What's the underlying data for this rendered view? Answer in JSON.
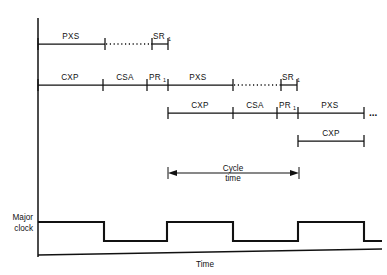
{
  "figure": {
    "axis": {
      "x_label": "Time",
      "y_label_line1": "Major",
      "y_label_line2": "clock"
    },
    "annotation": {
      "line1": "Cycle",
      "line2": "time"
    },
    "continuation_marker": "...",
    "colors": {
      "ink": "#111111",
      "background": "#ffffff"
    },
    "rows": [
      {
        "name": "row-1",
        "y": 44,
        "x_start": 38,
        "x_end": 168,
        "segments": [
          {
            "label": "PXS",
            "x1": 38,
            "x2": 105,
            "style": "solid"
          },
          {
            "label": "",
            "x1": 105,
            "x2": 152,
            "style": "dotted"
          },
          {
            "label": "SR",
            "sub": "1",
            "x1": 152,
            "x2": 168,
            "style": "solid"
          }
        ]
      },
      {
        "name": "row-2",
        "y": 85,
        "x_start": 38,
        "x_end": 297,
        "segments": [
          {
            "label": "CXP",
            "x1": 38,
            "x2": 103,
            "style": "solid"
          },
          {
            "label": "CSA",
            "x1": 103,
            "x2": 147,
            "style": "solid"
          },
          {
            "label": "PR",
            "sub": "1",
            "x1": 147,
            "x2": 168,
            "style": "solid"
          },
          {
            "label": "PXS",
            "x1": 168,
            "x2": 233,
            "style": "solid"
          },
          {
            "label": "",
            "x1": 233,
            "x2": 281,
            "style": "dotted"
          },
          {
            "label": "SR",
            "sub": "1",
            "x1": 281,
            "x2": 297,
            "style": "solid"
          }
        ]
      },
      {
        "name": "row-3",
        "y": 113,
        "x_start": 168,
        "x_end": 364,
        "trailing_ellipsis": "...",
        "segments": [
          {
            "label": "CXP",
            "x1": 168,
            "x2": 233,
            "style": "solid"
          },
          {
            "label": "CSA",
            "x1": 233,
            "x2": 277,
            "style": "solid"
          },
          {
            "label": "PR",
            "sub": "1",
            "x1": 277,
            "x2": 298,
            "style": "solid"
          },
          {
            "label": "PXS",
            "x1": 298,
            "x2": 364,
            "style": "solid"
          }
        ]
      },
      {
        "name": "row-4",
        "y": 141,
        "x_start": 298,
        "x_end": 364,
        "segments": [
          {
            "label": "CXP",
            "x1": 298,
            "x2": 364,
            "style": "solid"
          }
        ]
      }
    ],
    "cycle_arrow": {
      "y": 173,
      "x1": 168,
      "x2": 299
    },
    "clock": {
      "y_high": 222,
      "y_low": 241,
      "x_start": 38,
      "x_end": 382,
      "transitions": [
        104,
        167,
        233,
        298,
        364
      ],
      "start_level": "high"
    },
    "baseline": {
      "y_left": 255,
      "y_right": 249,
      "x1": 38,
      "x2": 382
    },
    "y_axis": {
      "x": 38,
      "y_top": 18,
      "y_bottom": 257
    }
  }
}
